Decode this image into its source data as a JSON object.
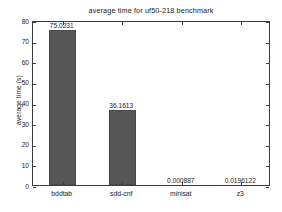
{
  "chart_data": {
    "type": "bar",
    "title": "average time for uf50-218 benchmark",
    "xlabel": "",
    "ylabel": "average time (s)",
    "categories": [
      "bddtab",
      "sdd-cnf",
      "minisat",
      "z3"
    ],
    "values": [
      75.0231,
      36.1613,
      0.000887,
      0.0196122
    ],
    "value_labels": [
      "75.0231",
      "36.1613",
      "0.000887",
      "0.0196122"
    ],
    "ylim": [
      0,
      80
    ],
    "yticks": [
      0,
      10,
      20,
      30,
      40,
      50,
      60,
      70,
      80
    ],
    "ytick_labels": [
      "0",
      "10",
      "20",
      "30",
      "40",
      "50",
      "60",
      "70",
      "80"
    ],
    "grid": false,
    "legend": null,
    "bar_color": "#565656",
    "axis_color": "#3c3c3c",
    "background": "#ffffff"
  }
}
